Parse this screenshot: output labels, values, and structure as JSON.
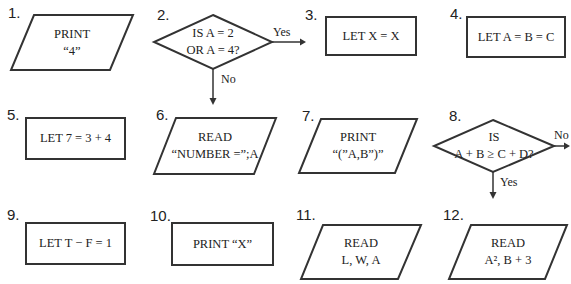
{
  "items": [
    {
      "number": "1.",
      "shape": "parallelogram",
      "lines": [
        "PRINT",
        "“4”"
      ]
    },
    {
      "number": "2.",
      "shape": "diamond",
      "lines": [
        "IS A = 2",
        "OR A = 4?"
      ],
      "right_branch": "Yes",
      "down_branch": "No"
    },
    {
      "number": "3.",
      "shape": "rectangle",
      "lines": [
        "LET X = X"
      ]
    },
    {
      "number": "4.",
      "shape": "rectangle",
      "lines": [
        "LET A = B = C"
      ]
    },
    {
      "number": "5.",
      "shape": "rectangle",
      "lines": [
        "LET 7 = 3 + 4"
      ]
    },
    {
      "number": "6.",
      "shape": "parallelogram",
      "lines": [
        "READ",
        "“NUMBER =”;A"
      ]
    },
    {
      "number": "7.",
      "shape": "parallelogram",
      "lines": [
        "PRINT",
        "“(”A,B”)”"
      ]
    },
    {
      "number": "8.",
      "shape": "diamond",
      "lines": [
        "IS",
        "A + B ≥ C + D?"
      ],
      "right_branch": "No",
      "down_branch": "Yes"
    },
    {
      "number": "9.",
      "shape": "rectangle",
      "lines": [
        "LET T − F = 1"
      ]
    },
    {
      "number": "10.",
      "shape": "rectangle",
      "lines": [
        "PRINT “X”"
      ]
    },
    {
      "number": "11.",
      "shape": "parallelogram",
      "lines": [
        "READ",
        "L, W, A"
      ]
    },
    {
      "number": "12.",
      "shape": "parallelogram",
      "lines": [
        "READ",
        "A², B + 3"
      ]
    }
  ]
}
